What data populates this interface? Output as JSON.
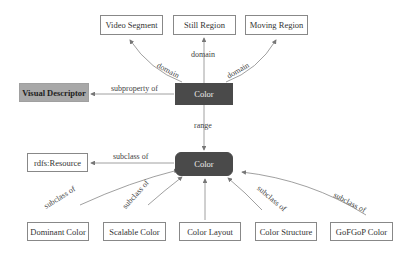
{
  "diagram": {
    "nodes": {
      "video_segment": "Video Segment",
      "still_region": "Still Region",
      "moving_region": "Moving Region",
      "visual_descriptor": "Visual Descriptor",
      "color_property": "Color",
      "color_class": "Color",
      "rdfs_resource": "rdfs:Resource",
      "dominant_color": "Dominant Color",
      "scalable_color": "Scalable Color",
      "color_layout": "Color Layout",
      "color_structure": "Color Structure",
      "gofgop_color": "GoFGoP Color"
    },
    "edges": {
      "domain_left": "domain",
      "domain_center": "domain",
      "domain_right": "domain",
      "subproperty": "subproperty of",
      "range": "range",
      "subclass_rdfs": "subclass of",
      "subclass_dominant": "subclass of",
      "subclass_scalable": "subclass of",
      "subclass_structure": "subclass of",
      "subclass_gofgop": "subclass of"
    },
    "colors": {
      "dark_node": "#4a4a4a",
      "gray_node": "#a8a8a8",
      "edge": "#888888"
    }
  }
}
